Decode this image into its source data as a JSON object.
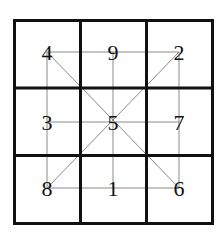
{
  "diagram": {
    "grid": [
      [
        "4",
        "9",
        "2"
      ],
      [
        "3",
        "5",
        "7"
      ],
      [
        "8",
        "1",
        "6"
      ]
    ],
    "colors": {
      "grid_line": "#111111",
      "connector_line": "#8a8a8a",
      "number": "#111111",
      "background": "#ffffff"
    },
    "connections": [
      {
        "from": [
          0,
          0
        ],
        "to": [
          0,
          2
        ]
      },
      {
        "from": [
          1,
          0
        ],
        "to": [
          1,
          2
        ]
      },
      {
        "from": [
          2,
          0
        ],
        "to": [
          2,
          2
        ]
      },
      {
        "from": [
          0,
          0
        ],
        "to": [
          2,
          0
        ]
      },
      {
        "from": [
          0,
          1
        ],
        "to": [
          2,
          1
        ]
      },
      {
        "from": [
          0,
          2
        ],
        "to": [
          2,
          2
        ]
      },
      {
        "from": [
          0,
          0
        ],
        "to": [
          2,
          2
        ]
      },
      {
        "from": [
          0,
          2
        ],
        "to": [
          2,
          0
        ]
      }
    ]
  }
}
